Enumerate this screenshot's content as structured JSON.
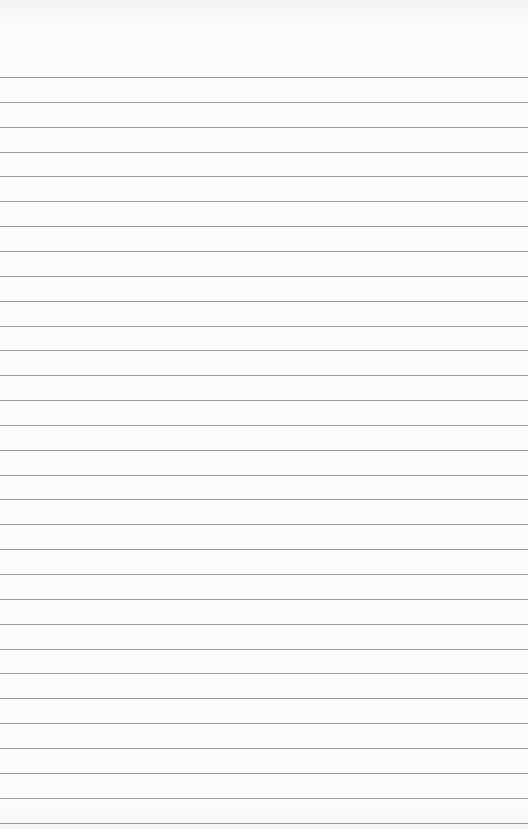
{
  "page": {
    "type": "lined-paper",
    "background_color": "#fcfcfc",
    "rule_color": "#9a9a9a",
    "first_rule_y": 77,
    "rule_spacing": 24.85,
    "rule_count": 31
  }
}
